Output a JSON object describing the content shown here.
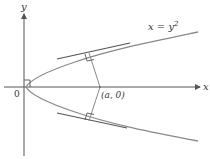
{
  "diagram": {
    "axes": {
      "x_label": "x",
      "y_label": "y",
      "origin_label": "0"
    },
    "curve": {
      "equation_lhs": "x = y",
      "equation_exp": "2",
      "color": "#8a8a8a"
    },
    "point": {
      "label": "(a, 0)"
    },
    "colors": {
      "axis": "#555555",
      "tangent": "#555555",
      "normal": "#8a8a8a",
      "text": "#333333"
    }
  }
}
